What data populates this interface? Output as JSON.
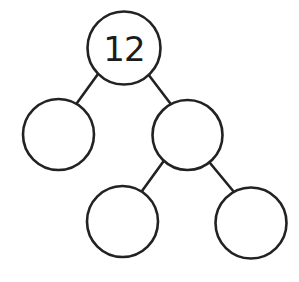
{
  "diagram": {
    "type": "number-bond-tree",
    "stroke_color": "#222222",
    "background": "#ffffff",
    "nodes": [
      {
        "id": "root",
        "label": "12",
        "cx": 124,
        "cy": 48,
        "r": 37
      },
      {
        "id": "left",
        "label": "",
        "cx": 58,
        "cy": 134,
        "r": 36
      },
      {
        "id": "right",
        "label": "",
        "cx": 188,
        "cy": 135,
        "r": 35
      },
      {
        "id": "right-left",
        "label": "",
        "cx": 123,
        "cy": 222,
        "r": 36
      },
      {
        "id": "right-right",
        "label": "",
        "cx": 251,
        "cy": 223,
        "r": 36
      }
    ],
    "edges": [
      {
        "from": "root",
        "to": "left"
      },
      {
        "from": "root",
        "to": "right"
      },
      {
        "from": "right",
        "to": "right-left"
      },
      {
        "from": "right",
        "to": "right-right"
      }
    ]
  }
}
